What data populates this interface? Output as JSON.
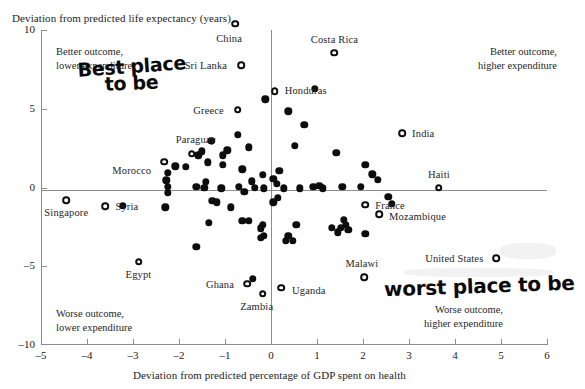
{
  "chart_data": {
    "type": "scatter",
    "title": "",
    "xlabel": "Deviation from predicted percentage of GDP spent on health",
    "ylabel": "Deviation from predicted life expectancy (years)",
    "xlim": [
      -5,
      6
    ],
    "ylim": [
      -10,
      10
    ],
    "xticks": [
      -5,
      -4,
      -3,
      -2,
      -1,
      0,
      1,
      2,
      3,
      4,
      5,
      6
    ],
    "yticks": [
      10,
      5,
      0,
      -5,
      -10
    ],
    "xtick_labels": [
      "–5",
      "–4",
      "–3",
      "–2",
      "–1",
      "0",
      "1",
      "2",
      "3",
      "4",
      "5",
      "6"
    ],
    "ytick_labels": [
      "10",
      "5",
      "0",
      "–5",
      "–10"
    ],
    "grid": false,
    "legend": "none",
    "reference_lines": {
      "horizontal": 0,
      "vertical": 0
    },
    "quadrant_notes": [
      {
        "id": "top-left",
        "text_line1": "Better outcome,",
        "text_line2": "lower expenditure"
      },
      {
        "id": "top-right",
        "text_line1": "Better outcome,",
        "text_line2": "higher expenditure"
      },
      {
        "id": "bottom-left",
        "text_line1": "Worse outcome,",
        "text_line2": "lower expenditure"
      },
      {
        "id": "bottom-right",
        "text_line1": "Worse outcome,",
        "text_line2": "higher expenditure"
      }
    ],
    "annotations": [
      {
        "id": "best-place",
        "text_line1": "Best place",
        "text_line2": "to be",
        "style": "handwritten"
      },
      {
        "id": "worst-place",
        "text_line1": "worst place to be",
        "style": "handwritten"
      }
    ],
    "labeled_points": [
      {
        "name": "China",
        "x": -0.78,
        "y": 10.4,
        "marker": "open",
        "label_dx": -6,
        "label_dy": 16,
        "align": "center"
      },
      {
        "name": "Sri Lanka",
        "x": -0.65,
        "y": 7.75,
        "marker": "open",
        "label_dx": -14,
        "label_dy": 2,
        "align": "right"
      },
      {
        "name": "Costa Rica",
        "x": 1.38,
        "y": 8.55,
        "marker": "open",
        "label_dx": 0,
        "label_dy": -12,
        "align": "center"
      },
      {
        "name": "Honduras",
        "x": 0.08,
        "y": 6.1,
        "marker": "open",
        "label_dx": 10,
        "label_dy": 1,
        "align": "left"
      },
      {
        "name": "Greece",
        "x": -0.72,
        "y": 4.95,
        "marker": "open",
        "label_dx": -14,
        "label_dy": 2,
        "align": "right"
      },
      {
        "name": "India",
        "x": 2.85,
        "y": 3.45,
        "marker": "open",
        "label_dx": 10,
        "label_dy": 2,
        "align": "left"
      },
      {
        "name": "Paraguay",
        "x": -1.72,
        "y": 2.15,
        "marker": "open",
        "label_dx": 4,
        "label_dy": -13,
        "align": "center"
      },
      {
        "name": "Morocco",
        "x": -2.32,
        "y": 1.65,
        "marker": "open",
        "label_dx": -13,
        "label_dy": 10,
        "align": "right"
      },
      {
        "name": "Haiti",
        "x": 3.65,
        "y": 0.0,
        "marker": "open",
        "label_dx": 0,
        "label_dy": -12,
        "align": "center"
      },
      {
        "name": "France",
        "x": 2.05,
        "y": -1.1,
        "marker": "open",
        "label_dx": 10,
        "label_dy": 2,
        "align": "left"
      },
      {
        "name": "Mozambique",
        "x": 2.35,
        "y": -1.7,
        "marker": "open",
        "label_dx": 10,
        "label_dy": 4,
        "align": "left"
      },
      {
        "name": "Singapore",
        "x": -4.45,
        "y": -0.8,
        "marker": "open",
        "label_dx": 0,
        "label_dy": 14,
        "align": "center"
      },
      {
        "name": "Syria",
        "x": -3.6,
        "y": -1.2,
        "marker": "open",
        "label_dx": 10,
        "label_dy": 2,
        "align": "left"
      },
      {
        "name": "Egypt",
        "x": -2.88,
        "y": -4.7,
        "marker": "open",
        "label_dx": 0,
        "label_dy": 14,
        "align": "center"
      },
      {
        "name": "Ghana",
        "x": -0.52,
        "y": -6.1,
        "marker": "open",
        "label_dx": -13,
        "label_dy": 2,
        "align": "right"
      },
      {
        "name": "Zambia",
        "x": -0.18,
        "y": -6.75,
        "marker": "open",
        "label_dx": -6,
        "label_dy": 14,
        "align": "center"
      },
      {
        "name": "Uganda",
        "x": 0.22,
        "y": -6.35,
        "marker": "open",
        "label_dx": 11,
        "label_dy": 4,
        "align": "left"
      },
      {
        "name": "Malawi",
        "x": 2.02,
        "y": -5.7,
        "marker": "open",
        "label_dx": -2,
        "label_dy": -12,
        "align": "center"
      },
      {
        "name": "United States",
        "x": 4.9,
        "y": -4.5,
        "marker": "open",
        "label_dx": -13,
        "label_dy": 2,
        "align": "right"
      }
    ],
    "unlabeled_points": [
      {
        "x": -0.12,
        "y": 5.6
      },
      {
        "x": 0.95,
        "y": 6.25
      },
      {
        "x": 0.38,
        "y": 4.85
      },
      {
        "x": -0.72,
        "y": 3.35
      },
      {
        "x": 0.72,
        "y": 4.0
      },
      {
        "x": -1.3,
        "y": 2.95
      },
      {
        "x": -1.58,
        "y": 2.05
      },
      {
        "x": -1.5,
        "y": 2.3
      },
      {
        "x": -0.95,
        "y": 2.35
      },
      {
        "x": -1.05,
        "y": 2.05
      },
      {
        "x": -0.48,
        "y": 2.55
      },
      {
        "x": 0.52,
        "y": 2.65
      },
      {
        "x": 1.42,
        "y": 2.2
      },
      {
        "x": -1.38,
        "y": 1.6
      },
      {
        "x": -2.08,
        "y": 1.35
      },
      {
        "x": -1.85,
        "y": 1.3
      },
      {
        "x": -1.05,
        "y": 1.45
      },
      {
        "x": -2.25,
        "y": 0.95
      },
      {
        "x": -0.62,
        "y": 1.15
      },
      {
        "x": 2.05,
        "y": 1.45
      },
      {
        "x": 0.18,
        "y": 1.05
      },
      {
        "x": -2.28,
        "y": 0.45
      },
      {
        "x": -0.18,
        "y": 0.8
      },
      {
        "x": 0.05,
        "y": 0.55
      },
      {
        "x": 2.2,
        "y": 0.85
      },
      {
        "x": -1.42,
        "y": 0.35
      },
      {
        "x": -0.42,
        "y": 0.4
      },
      {
        "x": 0.12,
        "y": 0.25
      },
      {
        "x": 2.32,
        "y": 0.5
      },
      {
        "x": -2.25,
        "y": 0.05
      },
      {
        "x": -1.62,
        "y": 0.05
      },
      {
        "x": -1.45,
        "y": 0.0
      },
      {
        "x": -1.08,
        "y": -0.05
      },
      {
        "x": -0.7,
        "y": 0.05
      },
      {
        "x": -0.35,
        "y": 0.0
      },
      {
        "x": -0.58,
        "y": -0.28
      },
      {
        "x": -0.15,
        "y": -0.05
      },
      {
        "x": 0.28,
        "y": -0.05
      },
      {
        "x": 0.62,
        "y": -0.05
      },
      {
        "x": 0.92,
        "y": 0.05
      },
      {
        "x": 1.05,
        "y": 0.1
      },
      {
        "x": 1.12,
        "y": -0.05
      },
      {
        "x": 1.55,
        "y": 0.05
      },
      {
        "x": 1.95,
        "y": 0.05
      },
      {
        "x": -2.25,
        "y": -0.35
      },
      {
        "x": 0.15,
        "y": -0.65
      },
      {
        "x": 0.05,
        "y": -0.95
      },
      {
        "x": 2.55,
        "y": -0.6
      },
      {
        "x": -1.28,
        "y": -0.85
      },
      {
        "x": -1.18,
        "y": -0.95
      },
      {
        "x": -2.3,
        "y": -1.25
      },
      {
        "x": -0.88,
        "y": -1.25
      },
      {
        "x": -3.22,
        "y": -1.15
      },
      {
        "x": 2.62,
        "y": -1.05
      },
      {
        "x": -1.35,
        "y": -2.25
      },
      {
        "x": -0.62,
        "y": -2.1
      },
      {
        "x": -0.48,
        "y": -2.1
      },
      {
        "x": -0.18,
        "y": -2.35
      },
      {
        "x": -0.22,
        "y": -2.6
      },
      {
        "x": 0.55,
        "y": -2.35
      },
      {
        "x": 1.58,
        "y": -2.05
      },
      {
        "x": 1.62,
        "y": -2.35
      },
      {
        "x": 1.32,
        "y": -2.55
      },
      {
        "x": 1.52,
        "y": -2.55
      },
      {
        "x": 1.68,
        "y": -2.7
      },
      {
        "x": 1.45,
        "y": -2.85
      },
      {
        "x": 2.05,
        "y": -2.95
      },
      {
        "x": 0.38,
        "y": -3.05
      },
      {
        "x": 0.32,
        "y": -3.4
      },
      {
        "x": 0.48,
        "y": -3.4
      },
      {
        "x": -0.15,
        "y": -3.05
      },
      {
        "x": -0.22,
        "y": -3.2
      },
      {
        "x": -1.62,
        "y": -3.75
      },
      {
        "x": -0.4,
        "y": -5.8
      }
    ]
  }
}
